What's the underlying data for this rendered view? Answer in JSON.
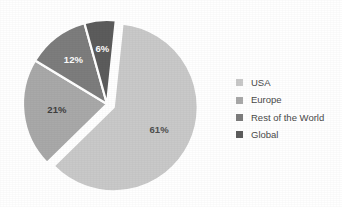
{
  "chart_data": {
    "type": "pie",
    "title": "",
    "subtitle": "",
    "xlabel": "",
    "ylabel": "",
    "grid": false,
    "legend_position": "right",
    "exploded": true,
    "categories": [
      "USA",
      "Europe",
      "Rest of the World",
      "Global"
    ],
    "values": [
      61,
      21,
      12,
      6
    ],
    "value_unit": "%",
    "slices": [
      {
        "label": "USA",
        "value": 61,
        "data_label": "61%",
        "color": "#c9c9c9",
        "label_color": "#4f4f4f",
        "exploded": true
      },
      {
        "label": "Europe",
        "value": 21,
        "data_label": "21%",
        "color": "#a9a9a9",
        "label_color": "#3f3f3f",
        "exploded": false
      },
      {
        "label": "Rest of the World",
        "value": 12,
        "data_label": "12%",
        "color": "#7d7d7d",
        "label_color": "#ffffff",
        "exploded": false
      },
      {
        "label": "Global",
        "value": 6,
        "data_label": "6%",
        "color": "#5c5c5c",
        "label_color": "#ffffff",
        "exploded": false
      }
    ],
    "legend": [
      {
        "label": "USA",
        "color": "#c9c9c9"
      },
      {
        "label": "Europe",
        "color": "#a9a9a9"
      },
      {
        "label": "Rest of the World",
        "color": "#7d7d7d"
      },
      {
        "label": "Global",
        "color": "#5c5c5c"
      }
    ],
    "background_color": "#ffffff"
  }
}
